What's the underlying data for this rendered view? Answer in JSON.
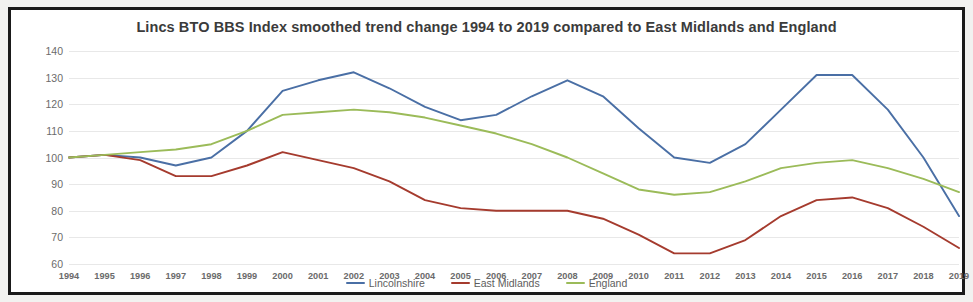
{
  "figure": {
    "frame_color": "#1a1a1a",
    "page_background": "#f2f2f0",
    "plot_background": "#ffffff"
  },
  "chart_data": {
    "type": "line",
    "title": "Lincs BTO BBS Index smoothed trend change 1994 to 2019 compared to East Midlands and England",
    "xlabel": "",
    "ylabel": "% increase / decrease since 1994",
    "ylim": [
      60,
      140
    ],
    "ytick_step": 10,
    "yticks": [
      60,
      70,
      80,
      90,
      100,
      110,
      120,
      130,
      140
    ],
    "grid": true,
    "legend_position": "bottom",
    "categories": [
      "1994",
      "1995",
      "1996",
      "1997",
      "1998",
      "1999",
      "2000",
      "2001",
      "2002",
      "2003",
      "2004",
      "2005",
      "2006",
      "2007",
      "2008",
      "2009",
      "2010",
      "2011",
      "2012",
      "2013",
      "2014",
      "2015",
      "2016",
      "2017",
      "2018",
      "2019"
    ],
    "series": [
      {
        "name": "Lincolnshire",
        "color": "#4a6fa5",
        "values": [
          100,
          101,
          100,
          97,
          100,
          110,
          125,
          129,
          132,
          126,
          119,
          114,
          116,
          123,
          129,
          123,
          111,
          100,
          98,
          105,
          118,
          131,
          131,
          118,
          100,
          78
        ]
      },
      {
        "name": "East Midlands",
        "color": "#a53b2e",
        "values": [
          100,
          101,
          99,
          93,
          93,
          97,
          102,
          99,
          96,
          91,
          84,
          81,
          80,
          80,
          80,
          77,
          71,
          64,
          64,
          69,
          78,
          84,
          85,
          81,
          74,
          66
        ]
      },
      {
        "name": "England",
        "color": "#9bbb59",
        "values": [
          100,
          101,
          102,
          103,
          105,
          110,
          116,
          117,
          118,
          117,
          115,
          112,
          109,
          105,
          100,
          94,
          88,
          86,
          87,
          91,
          96,
          98,
          99,
          96,
          92,
          87
        ]
      }
    ]
  },
  "legend": {
    "items": [
      {
        "label": "Lincolnshire",
        "color": "#4a6fa5"
      },
      {
        "label": "East Midlands",
        "color": "#a53b2e"
      },
      {
        "label": "England",
        "color": "#9bbb59"
      }
    ]
  }
}
